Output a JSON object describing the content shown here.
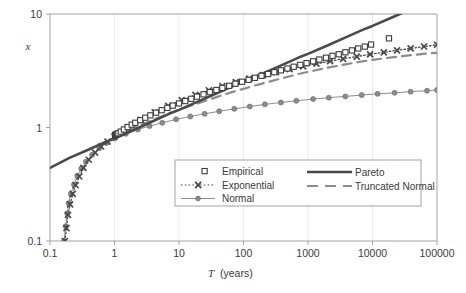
{
  "chart_data": {
    "type": "line",
    "title": "",
    "xlabel": "T  (years)",
    "ylabel": "x",
    "xscale": "log",
    "yscale": "log",
    "xlim": [
      0.1,
      100000
    ],
    "ylim": [
      0.1,
      10
    ],
    "grid": "vertical-minor-faint",
    "legend_position": "inside-bottom-center",
    "xticks": [
      "0.1",
      "1",
      "10",
      "100",
      "1000",
      "10000",
      "100000"
    ],
    "xtick_values": [
      0.1,
      1,
      10,
      100,
      1000,
      10000,
      100000
    ],
    "yticks": [
      "0.1",
      "1",
      "10"
    ],
    "ytick_values": [
      0.1,
      1,
      10
    ],
    "series": [
      {
        "name": "Empirical",
        "marker": "open-square",
        "line": "none",
        "color": "#3d3d3d",
        "points": [
          [
            1.02,
            0.86
          ],
          [
            1.06,
            0.87
          ],
          [
            1.1,
            0.88
          ],
          [
            1.15,
            0.89
          ],
          [
            1.25,
            0.92
          ],
          [
            1.4,
            0.96
          ],
          [
            1.6,
            1.01
          ],
          [
            1.85,
            1.06
          ],
          [
            2.1,
            1.1
          ],
          [
            2.5,
            1.16
          ],
          [
            3.0,
            1.22
          ],
          [
            3.6,
            1.28
          ],
          [
            4.4,
            1.35
          ],
          [
            5.4,
            1.42
          ],
          [
            6.6,
            1.49
          ],
          [
            8.0,
            1.56
          ],
          [
            10.0,
            1.63
          ],
          [
            12.5,
            1.71
          ],
          [
            15.5,
            1.79
          ],
          [
            19.0,
            1.87
          ],
          [
            24.0,
            1.96
          ],
          [
            30.0,
            2.05
          ],
          [
            38.0,
            2.14
          ],
          [
            47.0,
            2.23
          ],
          [
            60.0,
            2.33
          ],
          [
            75.0,
            2.43
          ],
          [
            95.0,
            2.53
          ],
          [
            120.0,
            2.63
          ],
          [
            150.0,
            2.74
          ],
          [
            190.0,
            2.85
          ],
          [
            240.0,
            2.96
          ],
          [
            300.0,
            3.07
          ],
          [
            380.0,
            3.19
          ],
          [
            480.0,
            3.31
          ],
          [
            600.0,
            3.43
          ],
          [
            760.0,
            3.56
          ],
          [
            950.0,
            3.69
          ],
          [
            1200.0,
            3.83
          ],
          [
            1500.0,
            3.97
          ],
          [
            1900.0,
            4.12
          ],
          [
            2400.0,
            4.28
          ],
          [
            3000.0,
            4.42
          ],
          [
            3800.0,
            4.6
          ],
          [
            4800.0,
            4.78
          ],
          [
            6000.0,
            4.97
          ],
          [
            7600.0,
            5.16
          ],
          [
            9500.0,
            5.38
          ],
          [
            18000.0,
            6.1
          ]
        ]
      },
      {
        "name": "Pareto",
        "marker": "none",
        "line": "solid-thick",
        "color": "#4a4a4a",
        "points": [
          [
            0.1,
            0.44
          ],
          [
            0.2,
            0.54
          ],
          [
            0.4,
            0.64
          ],
          [
            0.7,
            0.74
          ],
          [
            1.0,
            0.8
          ],
          [
            2.0,
            0.95
          ],
          [
            4.0,
            1.14
          ],
          [
            7.0,
            1.32
          ],
          [
            10.0,
            1.43
          ],
          [
            20.0,
            1.7
          ],
          [
            40.0,
            2.02
          ],
          [
            70.0,
            2.33
          ],
          [
            100.0,
            2.52
          ],
          [
            200.0,
            3.0
          ],
          [
            400.0,
            3.56
          ],
          [
            700.0,
            4.11
          ],
          [
            1000.0,
            4.45
          ],
          [
            2000.0,
            5.28
          ],
          [
            4000.0,
            6.28
          ],
          [
            7000.0,
            7.25
          ],
          [
            10000.0,
            7.85
          ],
          [
            20000.0,
            9.32
          ],
          [
            40000.0,
            11.08
          ],
          [
            100000.0,
            14.0
          ]
        ]
      },
      {
        "name": "Exponential",
        "marker": "x",
        "line": "dotted",
        "color": "#4a4a4a",
        "points": [
          [
            0.17,
            0.1
          ],
          [
            0.18,
            0.13
          ],
          [
            0.19,
            0.17
          ],
          [
            0.205,
            0.21
          ],
          [
            0.225,
            0.26
          ],
          [
            0.25,
            0.31
          ],
          [
            0.285,
            0.37
          ],
          [
            0.33,
            0.44
          ],
          [
            0.4,
            0.52
          ],
          [
            0.5,
            0.6
          ],
          [
            0.62,
            0.68
          ],
          [
            0.78,
            0.75
          ],
          [
            1.0,
            0.83
          ],
          [
            1.6,
            0.99
          ],
          [
            2.6,
            1.17
          ],
          [
            4.2,
            1.36
          ],
          [
            6.8,
            1.55
          ],
          [
            11.0,
            1.74
          ],
          [
            18.0,
            1.94
          ],
          [
            29.0,
            2.13
          ],
          [
            47.0,
            2.32
          ],
          [
            76.0,
            2.51
          ],
          [
            123.0,
            2.7
          ],
          [
            200.0,
            2.89
          ],
          [
            320.0,
            3.08
          ],
          [
            520.0,
            3.27
          ],
          [
            840.0,
            3.46
          ],
          [
            1350.0,
            3.65
          ],
          [
            2200.0,
            3.84
          ],
          [
            3500.0,
            4.03
          ],
          [
            5700.0,
            4.22
          ],
          [
            9200.0,
            4.41
          ],
          [
            15000.0,
            4.6
          ],
          [
            24000.0,
            4.79
          ],
          [
            39000.0,
            4.98
          ],
          [
            63000.0,
            5.17
          ],
          [
            100000.0,
            5.36
          ]
        ]
      },
      {
        "name": "Normal",
        "marker": "filled-circle",
        "line": "thin-solid",
        "color": "#8c8c8c",
        "points": [
          [
            0.165,
            0.1
          ],
          [
            0.175,
            0.135
          ],
          [
            0.185,
            0.175
          ],
          [
            0.195,
            0.215
          ],
          [
            0.21,
            0.26
          ],
          [
            0.235,
            0.315
          ],
          [
            0.265,
            0.375
          ],
          [
            0.305,
            0.435
          ],
          [
            0.36,
            0.5
          ],
          [
            0.45,
            0.575
          ],
          [
            0.58,
            0.655
          ],
          [
            0.75,
            0.73
          ],
          [
            1.0,
            0.8
          ],
          [
            1.5,
            0.88
          ],
          [
            2.3,
            0.96
          ],
          [
            3.5,
            1.03
          ],
          [
            5.5,
            1.1
          ],
          [
            9.0,
            1.18
          ],
          [
            15.0,
            1.25
          ],
          [
            25.0,
            1.32
          ],
          [
            42.0,
            1.39
          ],
          [
            72.0,
            1.46
          ],
          [
            125.0,
            1.53
          ],
          [
            215.0,
            1.6
          ],
          [
            380.0,
            1.66
          ],
          [
            660.0,
            1.72
          ],
          [
            1200.0,
            1.78
          ],
          [
            2100.0,
            1.83
          ],
          [
            3800.0,
            1.88
          ],
          [
            6800.0,
            1.93
          ],
          [
            12000.0,
            1.98
          ],
          [
            22000.0,
            2.02
          ],
          [
            39000.0,
            2.07
          ],
          [
            70000.0,
            2.11
          ],
          [
            100000.0,
            2.14
          ]
        ]
      },
      {
        "name": "Truncated Normal",
        "marker": "none",
        "line": "dashed",
        "color": "#8c8c8c",
        "points": [
          [
            1.0,
            0.82
          ],
          [
            2.0,
            0.99
          ],
          [
            4.0,
            1.17
          ],
          [
            7.0,
            1.33
          ],
          [
            10.0,
            1.43
          ],
          [
            20.0,
            1.64
          ],
          [
            40.0,
            1.87
          ],
          [
            70.0,
            2.07
          ],
          [
            100.0,
            2.19
          ],
          [
            200.0,
            2.45
          ],
          [
            400.0,
            2.72
          ],
          [
            700.0,
            2.95
          ],
          [
            1000.0,
            3.09
          ],
          [
            2000.0,
            3.36
          ],
          [
            4000.0,
            3.62
          ],
          [
            7000.0,
            3.83
          ],
          [
            10000.0,
            3.94
          ],
          [
            20000.0,
            4.15
          ],
          [
            40000.0,
            4.34
          ],
          [
            70000.0,
            4.48
          ],
          [
            100000.0,
            4.55
          ]
        ]
      }
    ]
  },
  "axes": {
    "y_label": "x",
    "x_label_italic": "T",
    "x_label_rest": "(years)",
    "x_ticks": [
      "0.1",
      "1",
      "10",
      "100",
      "1000",
      "10000",
      "100000"
    ],
    "y_ticks": [
      "10",
      "1",
      "0.1"
    ]
  },
  "legend": {
    "entries": [
      {
        "label": "Empirical",
        "key": "empirical"
      },
      {
        "label": "Exponential",
        "key": "exponential"
      },
      {
        "label": "Normal",
        "key": "normal"
      },
      {
        "label": "Pareto",
        "key": "pareto"
      },
      {
        "label": "Truncated Normal",
        "key": "truncated-normal"
      }
    ]
  },
  "colors": {
    "empirical": "#3d3d3d",
    "pareto": "#4a4a4a",
    "exponential": "#4a4a4a",
    "normal": "#8c8c8c",
    "truncated_normal": "#8c8c8c",
    "axis": "#808080",
    "grid": "#e8e8e8",
    "text": "#3a3a3a"
  }
}
